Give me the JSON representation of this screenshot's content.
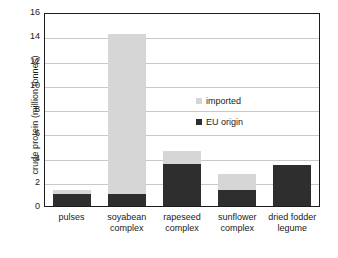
{
  "chart_data": {
    "type": "bar",
    "subtype": "stacked",
    "title": "",
    "xlabel": "",
    "ylabel": "crude protein (million tonnes)",
    "categories": [
      "pulses",
      "soyabean complex",
      "rapeseed complex",
      "sunflower complex",
      "dried fodder legume"
    ],
    "category_lines": [
      [
        "pulses"
      ],
      [
        "soyabean",
        "complex"
      ],
      [
        "rapeseed",
        "complex"
      ],
      [
        "sunflower",
        "complex"
      ],
      [
        "dried fodder",
        "legume"
      ]
    ],
    "series": [
      {
        "name": "EU origin",
        "color": "#2e2e2e",
        "values": [
          0.95,
          0.95,
          3.5,
          1.3,
          3.4
        ]
      },
      {
        "name": "imported",
        "color": "#d6d6d6",
        "values": [
          0.4,
          13.25,
          1.0,
          1.35,
          0.0
        ]
      }
    ],
    "totals": [
      1.35,
      14.2,
      4.5,
      2.65,
      3.4
    ],
    "ylim": [
      0,
      16
    ],
    "yticks": [
      0,
      2,
      4,
      6,
      8,
      10,
      12,
      14,
      16
    ],
    "ytick_labels": [
      "0",
      "2",
      "4",
      "6",
      "8",
      "10",
      "12",
      "14",
      "16"
    ],
    "grid": "horizontal",
    "grid_color": "#c9c9c9",
    "legend_position": "inside-right",
    "legend": [
      {
        "label": "imported",
        "color": "#d6d6d6"
      },
      {
        "label": "EU origin",
        "color": "#2e2e2e"
      }
    ],
    "frame_color": "#1c1c1c",
    "background": "#ffffff"
  }
}
